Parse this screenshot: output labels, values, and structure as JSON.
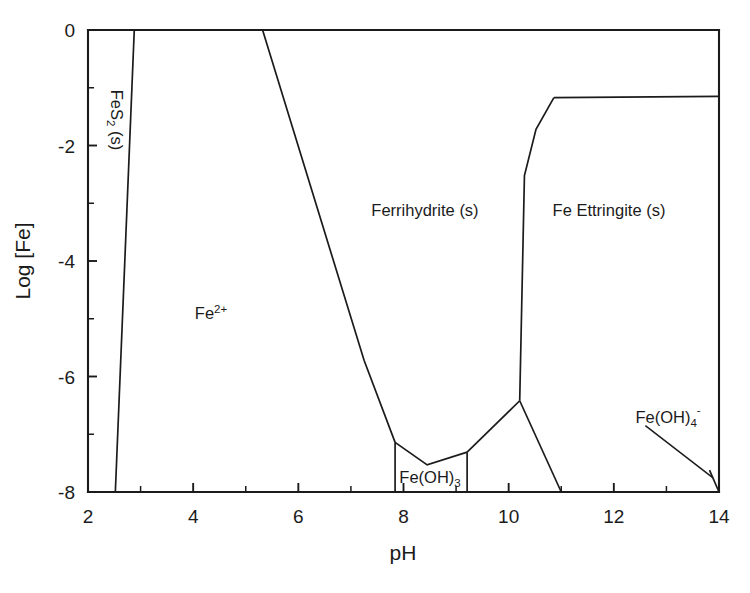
{
  "chart_data": {
    "type": "line",
    "title": "",
    "xlabel": "pH",
    "ylabel": "Log [Fe]",
    "xlim": [
      2,
      14
    ],
    "ylim": [
      -8,
      0
    ],
    "grid": false,
    "legend": "none",
    "x_ticks": [
      "2",
      "4",
      "6",
      "8",
      "10",
      "12",
      "14"
    ],
    "x_tick_values": [
      2,
      4,
      6,
      8,
      10,
      12,
      14
    ],
    "x_minor_tick_values": [
      3,
      5,
      7,
      9,
      11,
      13
    ],
    "y_ticks": [
      "0",
      "-2",
      "-4",
      "-6",
      "-8"
    ],
    "y_tick_values": [
      0,
      -2,
      -4,
      -6,
      -8
    ],
    "y_minor_tick_values": [
      -1,
      -3,
      -5,
      -7
    ],
    "regions": [
      {
        "id": "fes2",
        "label": "FeS",
        "label_sub": "2",
        "label_tail": " (s)",
        "label_full": "FeS2 (s)",
        "orientation": "vertical-cw",
        "label_x": 2.6,
        "label_y": -1.6
      },
      {
        "id": "fe2plus",
        "label": "Fe",
        "label_sup": "2+",
        "label_full": "Fe2+",
        "orientation": "horizontal",
        "label_x": 4.35,
        "label_y": -4.8
      },
      {
        "id": "ferrihydrite",
        "label_full": "Ferrihydrite (s)",
        "orientation": "horizontal",
        "label_x": 8.4,
        "label_y": -2.9
      },
      {
        "id": "fe-ettringite",
        "label_full": "Fe Ettringite (s)",
        "orientation": "horizontal",
        "label_x": 11.9,
        "label_y": -2.9
      },
      {
        "id": "feoh3",
        "label": "Fe(OH)",
        "label_sub": "3",
        "label_full": "Fe(OH)3",
        "orientation": "horizontal",
        "label_x": 8.45,
        "label_y": -7.75
      },
      {
        "id": "feoh4minus",
        "label": "Fe(OH)",
        "label_sub": "4",
        "label_sup": "-",
        "label_full": "Fe(OH)4-",
        "orientation": "horizontal",
        "label_x": 13.0,
        "label_y": -6.6,
        "has_leader": true
      }
    ],
    "boundaries": [
      {
        "name": "fes2-fe2plus-boundary",
        "points": [
          [
            2.88,
            0.0
          ],
          [
            2.52,
            -8.0
          ]
        ]
      },
      {
        "name": "fe2plus-ferrihydrite-boundary",
        "points": [
          [
            5.32,
            0.0
          ],
          [
            7.25,
            -5.72
          ],
          [
            7.84,
            -7.14
          ]
        ]
      },
      {
        "name": "feoh3-left-edge",
        "points": [
          [
            7.84,
            -7.14
          ],
          [
            7.84,
            -8.0
          ]
        ]
      },
      {
        "name": "ferrihydrite-feoh3-boundary",
        "points": [
          [
            7.84,
            -7.14
          ],
          [
            8.45,
            -7.53
          ],
          [
            9.21,
            -7.31
          ]
        ]
      },
      {
        "name": "feoh3-right-edge",
        "points": [
          [
            9.21,
            -7.31
          ],
          [
            9.21,
            -8.0
          ]
        ]
      },
      {
        "name": "ferrihydrite-ettringite-lower-boundary",
        "points": [
          [
            9.21,
            -7.31
          ],
          [
            10.21,
            -6.42
          ]
        ]
      },
      {
        "name": "ettringite-left-boundary",
        "points": [
          [
            10.21,
            -6.42
          ],
          [
            10.3,
            -2.52
          ],
          [
            10.52,
            -1.72
          ],
          [
            10.86,
            -1.17
          ]
        ]
      },
      {
        "name": "ettringite-top-boundary",
        "points": [
          [
            10.86,
            -1.17
          ],
          [
            14.0,
            -1.15
          ]
        ]
      },
      {
        "name": "ettringite-feoh4-boundary",
        "points": [
          [
            10.21,
            -6.42
          ],
          [
            11.0,
            -8.0
          ]
        ]
      },
      {
        "name": "feoh4-wedge-boundary",
        "points": [
          [
            13.82,
            -7.62
          ],
          [
            14.0,
            -8.0
          ]
        ]
      }
    ],
    "leader_line": {
      "name": "feoh4-leader",
      "points": [
        [
          12.6,
          -6.85
        ],
        [
          13.88,
          -7.75
        ]
      ]
    }
  },
  "axes": {
    "x_title": "pH",
    "y_title": "Log [Fe]"
  }
}
